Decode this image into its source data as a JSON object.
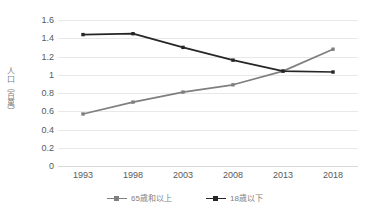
{
  "chart_data": {
    "type": "line",
    "title": "",
    "subtitle": "",
    "xlabel": "",
    "ylabel": "人口（百萬）",
    "categories": [
      "1993",
      "1998",
      "2003",
      "2008",
      "2013",
      "2018"
    ],
    "x": [
      1993,
      1998,
      2003,
      2008,
      2013,
      2018
    ],
    "series": [
      {
        "name": "65歳和以上",
        "color": "#7f7f7f",
        "marker": "square",
        "values": [
          0.57,
          0.7,
          0.81,
          0.89,
          1.04,
          1.28
        ]
      },
      {
        "name": "18歳以下",
        "color": "#262626",
        "marker": "square",
        "values": [
          1.44,
          1.45,
          1.3,
          1.16,
          1.04,
          1.03
        ]
      }
    ],
    "ylim": [
      0,
      1.6
    ],
    "yticks": [
      0,
      0.2,
      0.4,
      0.6,
      0.8,
      1,
      1.2,
      1.4,
      1.6
    ],
    "ytick_labels": [
      "0",
      "0.2",
      "0.4",
      "0.6",
      "0.8",
      "1",
      "1.2",
      "1.4",
      "1.6"
    ],
    "grid": {
      "horizontal": true,
      "vertical": false,
      "color": "#e8e8e8"
    },
    "legend": {
      "position": "bottom",
      "entries": [
        "65歳和以上",
        "18歳以下"
      ]
    },
    "plot_background": "#ffffff",
    "border": false
  },
  "axis": {
    "y_title": "人口（百萬）"
  },
  "legend": {
    "items": [
      {
        "label": "65歳和以上",
        "color": "#7f7f7f"
      },
      {
        "label": "18歳以下",
        "color": "#262626"
      }
    ]
  }
}
